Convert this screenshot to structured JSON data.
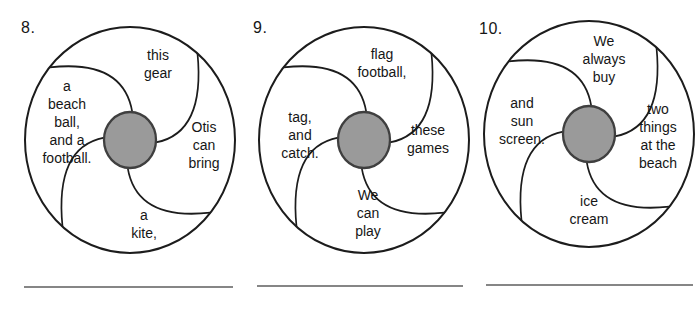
{
  "style": {
    "background": "#ffffff",
    "ink": "#1b1b1b",
    "wheel_fill": "#ffffff",
    "outline": "#1c1c1c",
    "hub_fill": "#9a9a9a",
    "hub_stroke": "#3f3f3f",
    "blank_line": "#868686"
  },
  "puzzles": [
    {
      "number": "8.",
      "segments": {
        "top": "this\ngear",
        "right": "Otis\ncan\nbring",
        "bottom": "a\nkite,",
        "left": "a\nbeach\nball,\nand a\nfootball."
      }
    },
    {
      "number": "9.",
      "segments": {
        "top": "flag\nfootball,",
        "right": "these\ngames",
        "bottom": "We\ncan\nplay",
        "left": "tag,\nand\ncatch."
      }
    },
    {
      "number": "10.",
      "segments": {
        "top": "We\nalways\nbuy",
        "right": "two\nthings\nat the\nbeach",
        "bottom": "ice\ncream",
        "left": "and\nsun\nscreen."
      }
    }
  ]
}
